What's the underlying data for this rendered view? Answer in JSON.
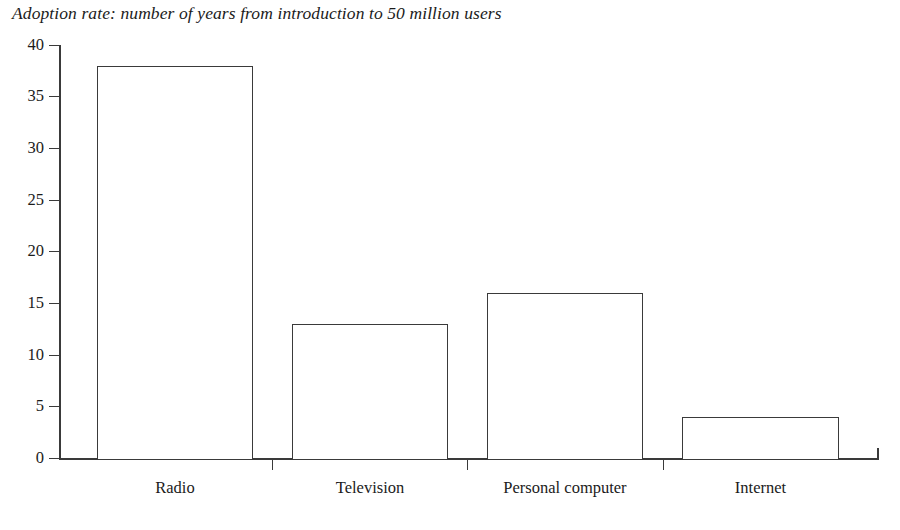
{
  "chart_data": {
    "type": "bar",
    "title": "Adoption rate: number of years from introduction to 50 million users",
    "xlabel": "",
    "ylabel": "",
    "categories": [
      "Radio",
      "Television",
      "Personal computer",
      "Internet"
    ],
    "values": [
      38,
      13,
      16,
      4
    ],
    "ylim": [
      0,
      40
    ],
    "yticks": [
      0,
      5,
      10,
      15,
      20,
      25,
      30,
      35,
      40
    ],
    "ytick_labels": [
      "0",
      "5",
      "10",
      "15",
      "20",
      "25",
      "30",
      "35",
      "40"
    ],
    "grid": false,
    "legend": null,
    "bar_fill_color": "#ffffff",
    "bar_edge_color": "#3a3a3a",
    "axis_color": "#3a3a3a",
    "text_color": "#1b1b1b",
    "background_color": "#ffffff"
  },
  "figure": {
    "title_text": "Adoption rate: number of years from introduction to 50 million users",
    "bars": [
      {
        "label": "Radio",
        "value": 38,
        "value_label": "38"
      },
      {
        "label": "Television",
        "value": 13,
        "value_label": "13"
      },
      {
        "label": "Personal computer",
        "value": 16,
        "value_label": "16"
      },
      {
        "label": "Internet",
        "value": 4,
        "value_label": "4"
      }
    ],
    "y_axis": {
      "ticks": [
        {
          "label": "40"
        },
        {
          "label": "35"
        },
        {
          "label": "30"
        },
        {
          "label": "25"
        },
        {
          "label": "20"
        },
        {
          "label": "15"
        },
        {
          "label": "10"
        },
        {
          "label": "5"
        },
        {
          "label": "0"
        }
      ]
    }
  }
}
